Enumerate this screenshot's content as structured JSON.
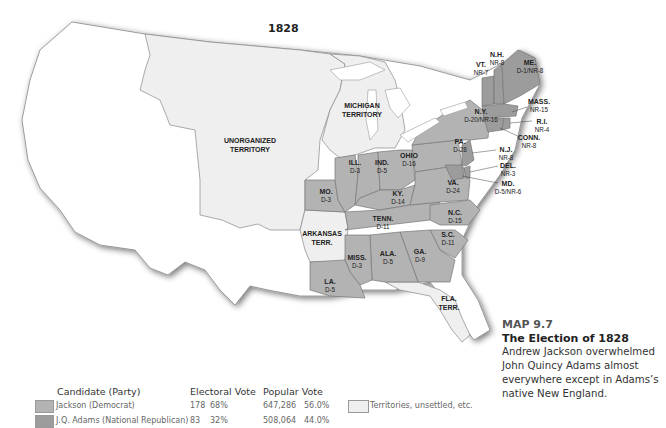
{
  "map": {
    "year_title": "1828",
    "colors": {
      "jackson": "#b3b3b3",
      "adams": "#9c9c9c",
      "territory": "#efefef",
      "foreign": "#ffffff",
      "water": "#ffffff"
    },
    "regions": [
      {
        "name": "UNORGANIZED TERRITORY",
        "line1": "UNORGANIZED",
        "line2": "TERRITORY",
        "fill": "territory"
      },
      {
        "name": "MICHIGAN TERRITORY",
        "line1": "MICHIGAN",
        "line2": "TERRITORY",
        "fill": "territory"
      },
      {
        "name": "ARKANSAS TERR.",
        "line1": "ARKANSAS",
        "line2": "TERR.",
        "fill": "territory"
      },
      {
        "name": "FLA. TERR.",
        "line1": "FLA.",
        "line2": "TERR.",
        "fill": "territory"
      }
    ],
    "states": [
      {
        "abbr": "ME.",
        "vote": "D-1/NR-8"
      },
      {
        "abbr": "N.H.",
        "vote": "NR-8"
      },
      {
        "abbr": "VT.",
        "vote": "NR-7"
      },
      {
        "abbr": "MASS.",
        "vote": "NR-15"
      },
      {
        "abbr": "R.I.",
        "vote": "NR-4"
      },
      {
        "abbr": "CONN.",
        "vote": "NR-8"
      },
      {
        "abbr": "N.Y.",
        "vote": "D-20/NR-16"
      },
      {
        "abbr": "N.J.",
        "vote": "NR-8"
      },
      {
        "abbr": "DEL.",
        "vote": "NR-3"
      },
      {
        "abbr": "MD.",
        "vote": "D-5/NR-6"
      },
      {
        "abbr": "PA.",
        "vote": "D-28"
      },
      {
        "abbr": "OHIO",
        "vote": "D-16"
      },
      {
        "abbr": "IND.",
        "vote": "D-5"
      },
      {
        "abbr": "ILL.",
        "vote": "D-3"
      },
      {
        "abbr": "MO.",
        "vote": "D-3"
      },
      {
        "abbr": "KY.",
        "vote": "D-14"
      },
      {
        "abbr": "VA.",
        "vote": "D-24"
      },
      {
        "abbr": "N.C.",
        "vote": "D-15"
      },
      {
        "abbr": "TENN.",
        "vote": "D-11"
      },
      {
        "abbr": "S.C.",
        "vote": "D-11"
      },
      {
        "abbr": "GA.",
        "vote": "D-9"
      },
      {
        "abbr": "ALA.",
        "vote": "D-5"
      },
      {
        "abbr": "MISS.",
        "vote": "D-3"
      },
      {
        "abbr": "LA.",
        "vote": "D-5"
      }
    ]
  },
  "legend": {
    "headers": {
      "candidate": "Candidate (Party)",
      "electoral": "Electoral Vote",
      "popular": "Popular Vote"
    },
    "rows": [
      {
        "candidate": "Jackson (Democrat)",
        "electoral_votes": "178",
        "electoral_pct": "68%",
        "popular_votes": "647,286",
        "popular_pct": "56.0%",
        "color": "#b3b3b3"
      },
      {
        "candidate": "J.Q. Adams (National Republican)",
        "electoral_votes": "83",
        "electoral_pct": "32%",
        "popular_votes": "508,064",
        "popular_pct": "44.0%",
        "color": "#9c9c9c"
      }
    ],
    "other": {
      "label": "Territories, unsettled, etc.",
      "color": "#efefef"
    }
  },
  "caption": {
    "number": "MAP 9.7",
    "title": "The Election of 1828",
    "body": "Andrew Jackson overwhelmed John Quincy Adams almost everywhere except in Adams’s native New England."
  }
}
